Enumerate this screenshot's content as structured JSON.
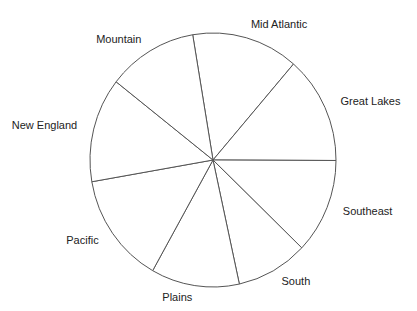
{
  "chart_data": {
    "type": "pie",
    "title": "",
    "start_angle_deg": 350.5,
    "direction": "clockwise",
    "categories": [
      "Mid Atlantic",
      "Great Lakes",
      "Southeast",
      "South",
      "Plains",
      "Pacific",
      "New England",
      "Mountain"
    ],
    "values": [
      14.0,
      13.7,
      12.1,
      9.4,
      11.6,
      14.1,
      13.3,
      11.8
    ],
    "unit": "percent",
    "fill_color": "#ffffff",
    "stroke_color": "#555555",
    "label_color": "#222222",
    "legend": "none"
  }
}
